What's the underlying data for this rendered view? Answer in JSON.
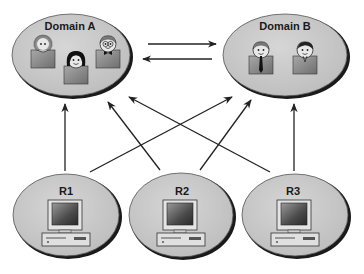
{
  "diagram": {
    "domains": [
      {
        "id": "domain-a",
        "label": "Domain A",
        "members": 3
      },
      {
        "id": "domain-b",
        "label": "Domain B",
        "members": 2
      }
    ],
    "resources": [
      {
        "id": "r1",
        "label": "R1"
      },
      {
        "id": "r2",
        "label": "R2"
      },
      {
        "id": "r3",
        "label": "R3"
      }
    ],
    "edges": [
      {
        "from": "Domain A",
        "to": "Domain B"
      },
      {
        "from": "Domain B",
        "to": "Domain A"
      },
      {
        "from": "R1",
        "to": "Domain A"
      },
      {
        "from": "R1",
        "to": "Domain B"
      },
      {
        "from": "R2",
        "to": "Domain A"
      },
      {
        "from": "R2",
        "to": "Domain B"
      },
      {
        "from": "R3",
        "to": "Domain A"
      },
      {
        "from": "R3",
        "to": "Domain B"
      }
    ],
    "colors": {
      "ellipse_fill": "#c9c9c9",
      "ellipse_stroke": "#1a1a1a",
      "arrow": "#222222"
    }
  }
}
